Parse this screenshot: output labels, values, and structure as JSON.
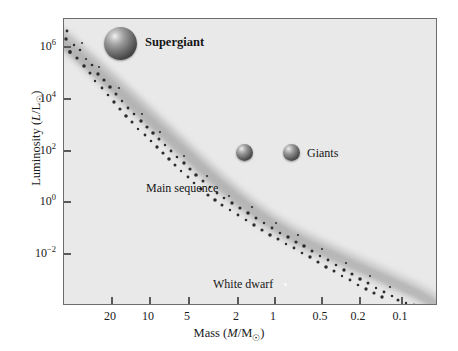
{
  "chart_data": {
    "type": "scatter",
    "title": "",
    "xlabel": "Mass (M/M☉)",
    "ylabel": "Luminosity (L/L☉)",
    "xlabel_parts": {
      "prefix": "Mass (",
      "italic": "M",
      "mid": "/M",
      "sun": "☉",
      "suffix": ")"
    },
    "ylabel_parts": {
      "prefix": "Luminosity (",
      "italic": "L",
      "mid": "/L",
      "sun": "☉",
      "suffix": ")"
    },
    "x_scale": "log",
    "y_scale": "log",
    "x_direction": "decreasing",
    "grid": false,
    "legend": "none",
    "xlim": [
      30,
      0.07
    ],
    "ylim": [
      0.0001,
      5000000.0
    ],
    "xticks": [
      {
        "label": "20",
        "value": 20,
        "px": 110
      },
      {
        "label": "10",
        "value": 10,
        "px": 148
      },
      {
        "label": "5",
        "value": 5,
        "px": 187
      },
      {
        "label": "2",
        "value": 2,
        "px": 236
      },
      {
        "label": "1",
        "value": 1,
        "px": 273
      },
      {
        "label": "0.5",
        "value": 0.5,
        "px": 320
      },
      {
        "label": "0.2",
        "value": 0.2,
        "px": 358
      },
      {
        "label": "0.1",
        "value": 0.1,
        "px": 400
      }
    ],
    "yticks": [
      {
        "mantissa": "10",
        "exponent": "6",
        "value": 1000000,
        "px": 45
      },
      {
        "mantissa": "10",
        "exponent": "4",
        "value": 10000,
        "px": 97
      },
      {
        "mantissa": "10",
        "exponent": "2",
        "value": 100,
        "px": 149
      },
      {
        "mantissa": "10",
        "exponent": "0",
        "value": 1,
        "px": 200
      },
      {
        "mantissa": "10",
        "exponent": "−2",
        "value": 0.01,
        "px": 252
      }
    ],
    "series": [
      {
        "name": "Main sequence",
        "kind": "band-of-points",
        "description": "Diagonal mass-luminosity relation band of scattered stars",
        "points": [
          {
            "mass": 30,
            "luminosity": 1400000
          },
          {
            "mass": 20,
            "luminosity": 300000
          },
          {
            "mass": 15,
            "luminosity": 100000
          },
          {
            "mass": 10,
            "luminosity": 20000
          },
          {
            "mass": 7,
            "luminosity": 4000
          },
          {
            "mass": 5,
            "luminosity": 1000
          },
          {
            "mass": 3,
            "luminosity": 150
          },
          {
            "mass": 2,
            "luminosity": 20
          },
          {
            "mass": 1.5,
            "luminosity": 5
          },
          {
            "mass": 1,
            "luminosity": 1
          },
          {
            "mass": 0.8,
            "luminosity": 0.4
          },
          {
            "mass": 0.5,
            "luminosity": 0.08
          },
          {
            "mass": 0.3,
            "luminosity": 0.012
          },
          {
            "mass": 0.2,
            "luminosity": 0.005
          },
          {
            "mass": 0.1,
            "luminosity": 0.0008
          },
          {
            "mass": 0.08,
            "luminosity": 0.0001
          }
        ]
      }
    ],
    "annotations": [
      {
        "name": "supergiant",
        "label": "Supergiant",
        "bold": true,
        "marker": "sphere-large",
        "marker_mass": 14,
        "marker_luminosity": 1000000
      },
      {
        "name": "giant-left",
        "label": "",
        "marker": "sphere-small",
        "marker_mass": 1.9,
        "marker_luminosity": 150
      },
      {
        "name": "giant-right",
        "label": "Giants",
        "bold": false,
        "marker": "sphere-small",
        "marker_mass": 1.1,
        "marker_luminosity": 150
      },
      {
        "name": "main-sequence",
        "label": "Main sequence",
        "bold": false,
        "marker": "none"
      },
      {
        "name": "white-dwarf",
        "label": "White dwarf",
        "bold": false,
        "marker": "white-dot",
        "marker_mass": 0.8,
        "marker_luminosity": 0.0005
      }
    ],
    "colors": {
      "plot_background": "#e9e9e9",
      "figure_background": "#ffffff",
      "frame": "#6d6d6d",
      "band_halo": "#c0c0c0",
      "star_point": "#2b2b2b",
      "text": "#161616",
      "white_dwarf_dot": "#fbfbfb"
    }
  },
  "axes": {
    "y_title": "Luminosity (L/L☉)",
    "x_title": "Mass (M/M☉)"
  },
  "labels": {
    "supergiant": "Supergiant",
    "giants": "Giants",
    "main_sequence": "Main sequence",
    "white_dwarf": "White dwarf"
  }
}
